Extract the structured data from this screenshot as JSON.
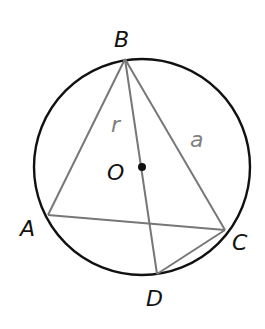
{
  "diagram": {
    "circle": {
      "cx": 142,
      "cy": 167,
      "r": 108,
      "stroke": "#111111"
    },
    "center": {
      "label": "O",
      "x": 142,
      "y": 167
    },
    "points": {
      "A": {
        "label": "A",
        "x": 48,
        "y": 215
      },
      "B": {
        "label": "B",
        "x": 125,
        "y": 59
      },
      "C": {
        "label": "C",
        "x": 225,
        "y": 230
      },
      "D": {
        "label": "D",
        "x": 157,
        "y": 274
      }
    },
    "segments": [
      {
        "from": "B",
        "to": "A"
      },
      {
        "from": "B",
        "to": "C"
      },
      {
        "from": "B",
        "to": "D"
      },
      {
        "from": "A",
        "to": "C"
      },
      {
        "from": "C",
        "to": "D"
      }
    ],
    "segment_labels": {
      "r": "r",
      "a": "a"
    },
    "colors": {
      "circle": "#111111",
      "segments": "#777777",
      "point_labels": "#111111",
      "segment_labels": "#808080"
    }
  }
}
